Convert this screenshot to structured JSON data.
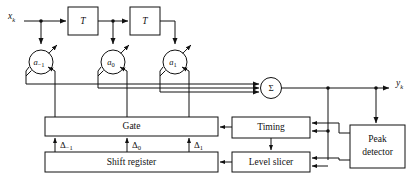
{
  "figure": {
    "type": "block-diagram",
    "background": "#ffffff",
    "line_color": "#111111"
  },
  "signals": {
    "input_label": "x",
    "input_subscript": "k",
    "output_label": "y",
    "output_subscript": "k"
  },
  "delay_blocks": [
    {
      "label": "T",
      "name": "delay-t1"
    },
    {
      "label": "T",
      "name": "delay-t2"
    }
  ],
  "tap_nodes": [
    {
      "label": "a",
      "subscript": "−1",
      "name": "tap-gain-a-minus1"
    },
    {
      "label": "a",
      "subscript": "0",
      "name": "tap-gain-a0"
    },
    {
      "label": "a",
      "subscript": "1",
      "name": "tap-gain-a1"
    }
  ],
  "summer": {
    "label": "Σ",
    "name": "summing-junction"
  },
  "control_signals": [
    {
      "label": "Δ",
      "subscript": "−1"
    },
    {
      "label": "Δ",
      "subscript": "0"
    },
    {
      "label": "Δ",
      "subscript": "1"
    }
  ],
  "blocks": [
    {
      "name": "gate-block",
      "label": "Gate"
    },
    {
      "name": "shift-register-block",
      "label": "Shift register"
    },
    {
      "name": "timing-block",
      "label": "Timing"
    },
    {
      "name": "level-slicer-block",
      "label": "Level slicer"
    },
    {
      "name": "peak-detector-block",
      "label1": "Peak",
      "label2": "detector"
    }
  ]
}
